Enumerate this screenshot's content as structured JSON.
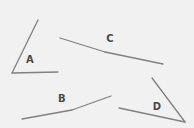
{
  "figure": {
    "type": "geometry-angle-diagram",
    "width": 194,
    "height": 128,
    "background_color": "#f1f1f1",
    "stroke_color": "#808080",
    "label_color": "#4a4a4a",
    "stroke_width": 1.3,
    "angles": [
      {
        "label": "A",
        "label_x": 30,
        "label_y": 60,
        "vertex": {
          "x": 12,
          "y": 73
        },
        "ray1_end": {
          "x": 38,
          "y": 20
        },
        "ray2_end": {
          "x": 58,
          "y": 72
        },
        "orientation": "vertex-bottom-left, acute opening up-right"
      },
      {
        "label": "C",
        "label_x": 110,
        "label_y": 39,
        "vertex": {
          "x": 105,
          "y": 52
        },
        "ray1_end": {
          "x": 60,
          "y": 38
        },
        "ray2_end": {
          "x": 163,
          "y": 64
        },
        "orientation": "nearly straight, obtuse opening downward"
      },
      {
        "label": "B",
        "label_x": 62,
        "label_y": 99,
        "vertex": {
          "x": 72,
          "y": 110
        },
        "ray1_end": {
          "x": 22,
          "y": 119
        },
        "ray2_end": {
          "x": 111,
          "y": 96
        },
        "orientation": "nearly straight, obtuse opening upward"
      },
      {
        "label": "D",
        "label_x": 157,
        "label_y": 107,
        "vertex": {
          "x": 185,
          "y": 122
        },
        "ray1_end": {
          "x": 152,
          "y": 78
        },
        "ray2_end": {
          "x": 119,
          "y": 108
        },
        "orientation": "vertex-bottom-right, acute opening up-left"
      }
    ]
  }
}
